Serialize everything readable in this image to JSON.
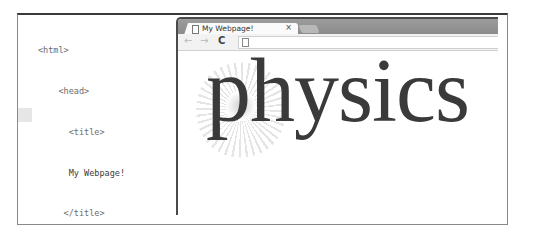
{
  "editor": {
    "lines": [
      {
        "indent": 0,
        "text": "<html>"
      },
      {
        "indent": 1,
        "text": "<head>"
      },
      {
        "indent": 2,
        "text": "<title>"
      },
      {
        "indent": 2,
        "text": "My Webpage!"
      },
      {
        "indent": 1,
        "text": "</title>"
      },
      {
        "indent": 1,
        "text": "</head>"
      },
      {
        "indent": 1,
        "text": "<body>"
      },
      {
        "indent": 1,
        "text": "<img src = \"physics.png\">"
      },
      {
        "indent": 1,
        "text": "</body>"
      },
      {
        "indent": 0,
        "text": "</html>"
      }
    ]
  },
  "browser": {
    "tab_title": "My Webpage!",
    "tab_close": "×",
    "nav": {
      "back": "←",
      "forward": "→",
      "reload": "C"
    },
    "address": ""
  },
  "page": {
    "image_text": "physics"
  }
}
